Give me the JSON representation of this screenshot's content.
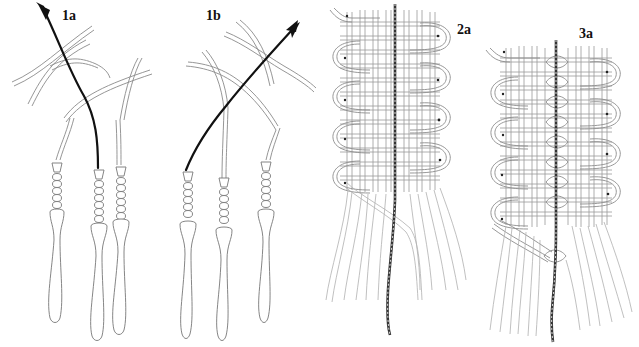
{
  "figure": {
    "panels": [
      {
        "id": "1a",
        "label": "1a",
        "content": "black cord with arrow passing through twisted cords, ending in three beaded tassels"
      },
      {
        "id": "1b",
        "label": "1b",
        "content": "black cord with arrow passing diagonally through twisted cords, ending in three beaded tassels"
      },
      {
        "id": "2a",
        "label": "2a",
        "content": "woven grid band with central dark core cord and looped edges with dots, loose strands below"
      },
      {
        "id": "3a",
        "label": "3a",
        "content": "woven grid band split by central dark core cord with interlocked twist links, looped edges with dots, loose strands below"
      }
    ],
    "colors": {
      "background": "#ffffff",
      "line": "#8a8a8a",
      "dark_cord": "#111111",
      "label": "#111111"
    }
  }
}
